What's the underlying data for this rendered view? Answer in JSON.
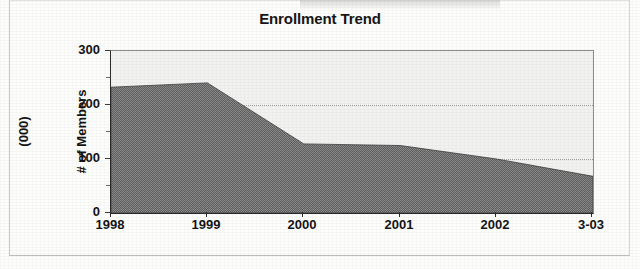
{
  "chart_data": {
    "type": "area",
    "title": "Enrollment Trend",
    "xlabel": "",
    "ylabel": "# of Members (000)",
    "ylabel_line1": "# of Members",
    "ylabel_line2": "(000)",
    "categories": [
      "1998",
      "1999",
      "2000",
      "2001",
      "2002",
      "3-03"
    ],
    "values": [
      233,
      241,
      128,
      125,
      100,
      68
    ],
    "series": [
      {
        "name": "Enrollment",
        "values": [
          233,
          241,
          128,
          125,
          100,
          68
        ]
      }
    ],
    "ylim": [
      0,
      300
    ],
    "yticks": [
      0,
      100,
      200,
      300
    ],
    "ytick_labels": [
      "0",
      "100",
      "200",
      "300"
    ],
    "y_minor_ticks": [
      50,
      150,
      250
    ],
    "grid": true,
    "gridlines_at": [
      100,
      200
    ],
    "legend": false,
    "legend_position": "none",
    "colors": {
      "area_fill": "#6b6b6b",
      "plot_background": "#f2f2f0",
      "axis": "#2b2b2b",
      "gridline": "#9a9a9a",
      "text": "#141414"
    }
  }
}
